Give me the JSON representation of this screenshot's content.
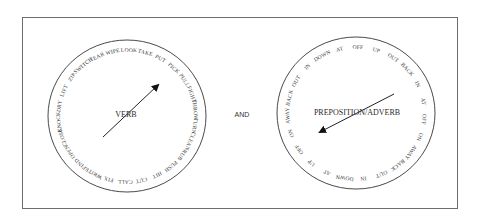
{
  "diagram": {
    "connector_label": "AND",
    "dials": [
      {
        "id": "verb",
        "center_label": "VERB",
        "center": [
          127,
          116
        ],
        "radius": [
          79,
          76
        ],
        "arrow": {
          "from": [
            103,
            137
          ],
          "to": [
            158,
            85
          ]
        },
        "label_pos": [
          126,
          117
        ],
        "start_angle_deg": -116,
        "words": [
          "TEAR",
          "WIPE",
          "LOOK",
          "TAKE",
          "PUT",
          "PICK",
          "PULL",
          "FIGHT",
          "THROW",
          "TURN",
          "CLEAN",
          "RUB",
          "PUSH",
          "HIT",
          "CUT",
          "CALL",
          "FIX",
          "WRITE",
          "FIND",
          "OPEN",
          "CLOSE",
          "KNOCK",
          "DRY",
          "LIFT",
          "ZIP",
          "SWITCH"
        ]
      },
      {
        "id": "preposition-adverb",
        "center_label": "PREPOSITION/ADVERB",
        "center": [
          356,
          113
        ],
        "radius": [
          79,
          76
        ],
        "arrow": {
          "from": [
            394,
            94
          ],
          "to": [
            320,
            132
          ]
        },
        "label_pos": [
          357,
          115
        ],
        "start_angle_deg": -104,
        "words": [
          "AT",
          "OFF",
          "UP",
          "OUT",
          "BACK",
          "IN",
          "AT",
          "OFF",
          "ON",
          "AWAY",
          "BACK",
          "OUT",
          "IN",
          "DOWN",
          "AT",
          "UP",
          "OFF",
          "ON",
          "AWAY",
          "BACK",
          "OUT",
          "IN",
          "DOWN"
        ]
      }
    ]
  }
}
